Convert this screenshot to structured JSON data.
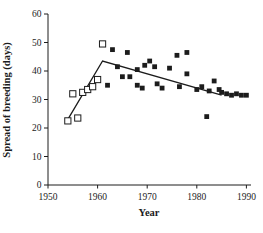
{
  "chart_data": {
    "type": "scatter",
    "title": "",
    "xlabel": "Year",
    "ylabel": "Spread of breeding (days)",
    "xlim": [
      1950,
      1990
    ],
    "ylim": [
      0,
      60
    ],
    "x_ticks": [
      1950,
      1960,
      1970,
      1980,
      1990
    ],
    "y_ticks": [
      0,
      10,
      20,
      30,
      40,
      50,
      60
    ],
    "grid": false,
    "legend": "none",
    "series": [
      {
        "name": "open_squares",
        "marker": "open-square",
        "points": [
          [
            1954,
            22.5
          ],
          [
            1955,
            32
          ],
          [
            1956,
            23.5
          ],
          [
            1957,
            32.5
          ],
          [
            1958,
            33.5
          ],
          [
            1959,
            34.5
          ],
          [
            1960,
            37
          ],
          [
            1961,
            49.5
          ]
        ]
      },
      {
        "name": "filled_squares",
        "marker": "filled-square",
        "points": [
          [
            1962,
            35
          ],
          [
            1963,
            47.5
          ],
          [
            1964,
            41.5
          ],
          [
            1965,
            38
          ],
          [
            1966,
            46.5
          ],
          [
            1966.5,
            38
          ],
          [
            1968,
            40.5
          ],
          [
            1968,
            35
          ],
          [
            1969,
            34
          ],
          [
            1969.5,
            42
          ],
          [
            1970.5,
            43.5
          ],
          [
            1971.5,
            41.5
          ],
          [
            1972,
            35.5
          ],
          [
            1973,
            34
          ],
          [
            1974.5,
            41
          ],
          [
            1976,
            45.5
          ],
          [
            1976.5,
            34.5
          ],
          [
            1978,
            46.5
          ],
          [
            1978,
            39
          ],
          [
            1980,
            33.5
          ],
          [
            1981,
            34.5
          ],
          [
            1982,
            24
          ],
          [
            1982.5,
            33
          ],
          [
            1983.5,
            36.5
          ],
          [
            1984.5,
            33.5
          ],
          [
            1985,
            32.5
          ],
          [
            1986,
            32
          ],
          [
            1987,
            31.5
          ],
          [
            1988,
            32
          ],
          [
            1989,
            31.5
          ],
          [
            1990,
            31.5
          ]
        ]
      }
    ],
    "trend_line": [
      [
        1954,
        23
      ],
      [
        1961,
        43.5
      ],
      [
        1985,
        31.5
      ]
    ],
    "colors": {
      "ink": "#1c1c1c",
      "open_marker_fill": "#ffffff",
      "background": "#ffffff"
    }
  }
}
